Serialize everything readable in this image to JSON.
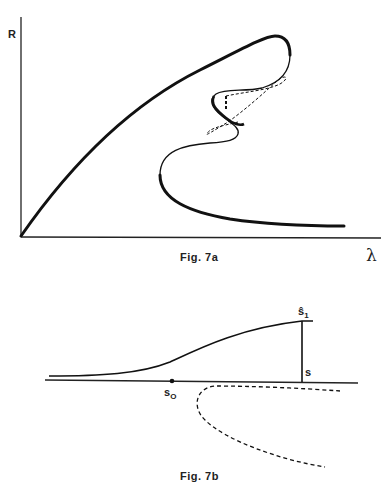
{
  "figure_a": {
    "caption": "Fig. 7a",
    "y_axis_label": "R",
    "x_axis_label": "λ",
    "curves": [
      {
        "name": "main-branch",
        "style": "solid-thick",
        "description": "rises from origin, folds back near top right"
      },
      {
        "name": "s-loop-branch",
        "style": "solid-thin",
        "description": "S-shaped interior loop"
      },
      {
        "name": "isola",
        "style": "dashed",
        "description": "closed dashed loop intertwined with S-loop"
      },
      {
        "name": "lower-branch",
        "style": "solid-thick",
        "description": "turns at left and decays toward lambda axis"
      }
    ]
  },
  "figure_b": {
    "caption": "Fig. 7b",
    "labels": {
      "s0": "s",
      "s0_sub": "O",
      "s": "s",
      "s1": "ŝ",
      "s1_sub": "1"
    },
    "curves": [
      {
        "name": "horizontal-axis",
        "style": "solid"
      },
      {
        "name": "upper-sigmoid",
        "style": "solid"
      },
      {
        "name": "vertical-jump",
        "style": "solid"
      },
      {
        "name": "lower-fold",
        "style": "dashed"
      }
    ]
  }
}
